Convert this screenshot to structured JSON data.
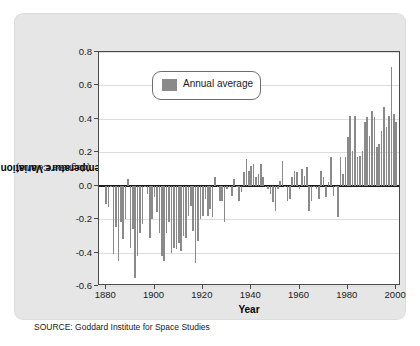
{
  "source_note": "SOURCE: Goddard Institute for Space Studies",
  "legend": {
    "label": "Annual average",
    "swatch_color": "#8a8a8a"
  },
  "axis": {
    "ylabel_main": "Temperature Variation",
    "ylabel_sub": "(degrees Celsius)",
    "xlabel": "Year",
    "yticks": [
      "0.8",
      "0.6",
      "0.4",
      "0.2",
      "0.0",
      "-0.2",
      "-0.4",
      "-0.6"
    ],
    "ytick_values": [
      0.8,
      0.6,
      0.4,
      0.2,
      0.0,
      -0.2,
      -0.4,
      -0.6
    ],
    "xticks": [
      "1880",
      "1900",
      "1920",
      "1940",
      "1960",
      "1980",
      "2000"
    ],
    "xtick_values": [
      1880,
      1900,
      1920,
      1940,
      1960,
      1980,
      2000
    ]
  },
  "colors": {
    "bar": "#8a8a8a",
    "card_background": "#e6e6e6",
    "plot_background": "#ffffff",
    "grid": "#dddddd",
    "axis": "#4a4a4a",
    "zero_line": "#1a1a1a"
  },
  "chart_data": {
    "type": "bar",
    "title": "",
    "xlabel": "Year",
    "ylabel": "Temperature Variation (degrees Celsius)",
    "xlim": [
      1877,
      2002
    ],
    "ylim": [
      -0.6,
      0.8
    ],
    "grid": true,
    "legend": [
      "Annual average"
    ],
    "legend_position": "top-left-inside",
    "zero_reference_line": 0.0,
    "x": [
      1880,
      1881,
      1882,
      1883,
      1884,
      1885,
      1886,
      1887,
      1888,
      1889,
      1890,
      1891,
      1892,
      1893,
      1894,
      1895,
      1896,
      1897,
      1898,
      1899,
      1900,
      1901,
      1902,
      1903,
      1904,
      1905,
      1906,
      1907,
      1908,
      1909,
      1910,
      1911,
      1912,
      1913,
      1914,
      1915,
      1916,
      1917,
      1918,
      1919,
      1920,
      1921,
      1922,
      1923,
      1924,
      1925,
      1926,
      1927,
      1928,
      1929,
      1930,
      1931,
      1932,
      1933,
      1934,
      1935,
      1936,
      1937,
      1938,
      1939,
      1940,
      1941,
      1942,
      1943,
      1944,
      1945,
      1946,
      1947,
      1948,
      1949,
      1950,
      1951,
      1952,
      1953,
      1954,
      1955,
      1956,
      1957,
      1958,
      1959,
      1960,
      1961,
      1962,
      1963,
      1964,
      1965,
      1966,
      1967,
      1968,
      1969,
      1970,
      1971,
      1972,
      1973,
      1974,
      1975,
      1976,
      1977,
      1978,
      1979,
      1980,
      1981,
      1982,
      1983,
      1984,
      1985,
      1986,
      1987,
      1988,
      1989,
      1990,
      1991,
      1992,
      1993,
      1994,
      1995,
      1996,
      1997,
      1998,
      1999,
      2000
    ],
    "series": [
      {
        "name": "Annual average",
        "color": "#8a8a8a",
        "values": [
          -0.11,
          -0.13,
          -0.01,
          -0.41,
          -0.25,
          -0.45,
          -0.22,
          -0.32,
          -0.2,
          0.04,
          -0.37,
          -0.26,
          -0.55,
          -0.42,
          -0.28,
          -0.23,
          -0.01,
          -0.05,
          -0.31,
          -0.2,
          -0.07,
          -0.16,
          -0.28,
          -0.42,
          -0.45,
          -0.28,
          -0.22,
          -0.4,
          -0.37,
          -0.38,
          -0.34,
          -0.39,
          -0.3,
          -0.31,
          -0.18,
          -0.12,
          -0.27,
          -0.46,
          -0.33,
          -0.2,
          -0.18,
          -0.08,
          -0.18,
          -0.14,
          -0.19,
          0.05,
          -0.01,
          -0.09,
          -0.09,
          -0.22,
          -0.02,
          -0.01,
          -0.06,
          0.04,
          0.0,
          -0.09,
          -0.04,
          0.08,
          0.16,
          0.09,
          0.12,
          0.13,
          0.05,
          0.07,
          0.13,
          0.05,
          -0.01,
          -0.02,
          -0.05,
          -0.1,
          -0.15,
          -0.02,
          0.03,
          0.15,
          0.0,
          -0.09,
          -0.08,
          0.05,
          0.09,
          0.08,
          -0.02,
          0.1,
          0.06,
          0.11,
          -0.15,
          -0.09,
          0.0,
          -0.02,
          -0.08,
          0.09,
          0.05,
          -0.07,
          0.02,
          0.17,
          -0.06,
          -0.01,
          -0.19,
          0.17,
          0.07,
          0.17,
          0.29,
          0.42,
          0.21,
          0.42,
          0.17,
          0.18,
          0.21,
          0.38,
          0.41,
          0.3,
          0.45,
          0.41,
          0.23,
          0.25,
          0.33,
          0.47,
          0.35,
          0.42,
          0.71,
          0.43,
          0.38
        ]
      }
    ]
  }
}
